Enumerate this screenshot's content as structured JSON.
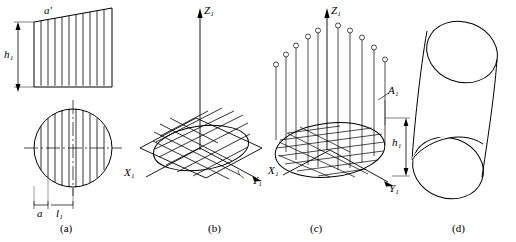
{
  "figure": {
    "title": "",
    "panels": [
      {
        "id": "a",
        "caption": "(a)",
        "labels": [
          {
            "name": "a-prime",
            "text": "a′"
          },
          {
            "name": "h1",
            "text": "h₁"
          },
          {
            "name": "a",
            "text": "a"
          },
          {
            "name": "l1",
            "text": "l₁"
          }
        ]
      },
      {
        "id": "b",
        "caption": "(b)",
        "labels": [
          {
            "name": "z1-axis",
            "text": "Z₁"
          },
          {
            "name": "x1-axis",
            "text": "X₁"
          },
          {
            "name": "y1-axis",
            "text": "Y₁"
          }
        ]
      },
      {
        "id": "c",
        "caption": "(c)",
        "labels": [
          {
            "name": "z1-axis",
            "text": "Z₁"
          },
          {
            "name": "a1-point",
            "text": "A₁"
          },
          {
            "name": "h1",
            "text": "h₁"
          },
          {
            "name": "x1-axis",
            "text": "X₁"
          },
          {
            "name": "y1-axis",
            "text": "Y₁"
          }
        ]
      },
      {
        "id": "d",
        "caption": "(d)",
        "labels": []
      }
    ]
  }
}
